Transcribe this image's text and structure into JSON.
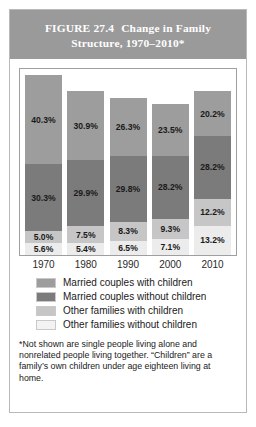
{
  "figure": {
    "number_label": "FIGURE 27.4",
    "title": "Change in Family",
    "title_line2": "Structure, 1970–2010*"
  },
  "footnote": "*Not shown are single people living alone and nonrelated people living together. “Children” are a family’s own children under age eighteen living at home.",
  "colors": {
    "married_with_children": "#9d9d9d",
    "married_without_children": "#7b7b7b",
    "other_with_children": "#c6c6c6",
    "other_without_children": "#ececec",
    "title_band": "#9a9a9a",
    "frame": "#9e9e9e"
  },
  "chart_data": {
    "type": "bar",
    "xlabel": "",
    "ylabel": "",
    "stacked": true,
    "grid": false,
    "legend_position": "below",
    "ylim": [
      0,
      82
    ],
    "categories": [
      "1970",
      "1980",
      "1990",
      "2000",
      "2010"
    ],
    "series": [
      {
        "name": "Married couples with children",
        "color": "#9d9d9d",
        "values": [
          40.3,
          30.9,
          26.3,
          23.5,
          20.2
        ],
        "labels": [
          "40.3%",
          "30.9%",
          "26.3%",
          "23.5%",
          "20.2%"
        ]
      },
      {
        "name": "Married couples without children",
        "color": "#7b7b7b",
        "values": [
          30.3,
          29.9,
          29.8,
          28.2,
          28.2
        ],
        "labels": [
          "30.3%",
          "29.9%",
          "29.8%",
          "28.2%",
          "28.2%"
        ]
      },
      {
        "name": "Other families with children",
        "color": "#c6c6c6",
        "values": [
          5.0,
          7.5,
          8.3,
          9.3,
          12.2
        ],
        "labels": [
          "5.0%",
          "7.5%",
          "8.3%",
          "9.3%",
          "12.2%"
        ]
      },
      {
        "name": "Other families without children",
        "color": "#ececec",
        "values": [
          5.6,
          5.4,
          6.5,
          7.1,
          13.2
        ],
        "labels": [
          "5.6%",
          "5.4%",
          "6.5%",
          "7.1%",
          "13.2%"
        ]
      }
    ]
  }
}
